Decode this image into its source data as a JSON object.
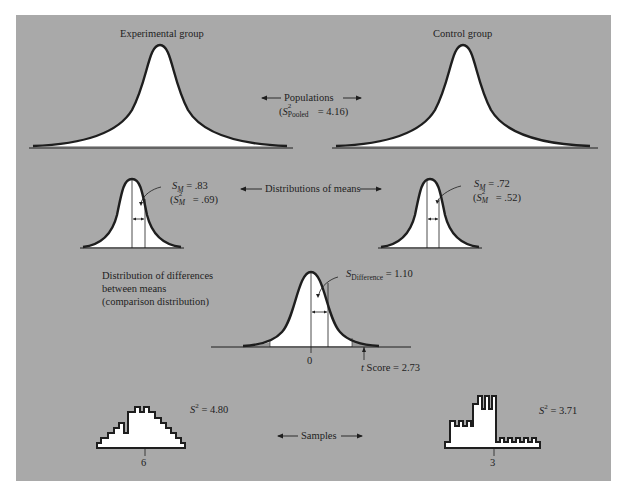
{
  "figure": {
    "background_color": "#a9a9a9",
    "curve_fill": "#ffffff",
    "stroke_color": "#1e1e1e",
    "tail_fill": "#9a9a9a"
  },
  "populations": {
    "experimental_title": "Experimental group",
    "control_title": "Control group",
    "center_label": "Populations",
    "pooled_variance": {
      "symbol": "S",
      "superscript": "2",
      "subscript": "Pooled",
      "value_text": "= 4.16)",
      "open_paren": "("
    }
  },
  "distributions_of_means": {
    "center_label": "Distributions of means",
    "experimental": {
      "sm_symbol": "S",
      "sm_sub": "M",
      "sm_value": "= .83",
      "var_symbol": "S",
      "var_sup": "2",
      "var_sub": "M",
      "var_value": "= .69)",
      "open_paren": "("
    },
    "control": {
      "sm_symbol": "S",
      "sm_sub": "M",
      "sm_value": "= .72",
      "var_symbol": "S",
      "var_sup": "2",
      "var_sub": "M",
      "var_value": "= .52)",
      "open_paren": "("
    }
  },
  "comparison_distribution": {
    "title_lines": [
      "Distribution of differences",
      "between means",
      "(comparison distribution)"
    ],
    "sd_symbol": "S",
    "sd_sub": "Difference",
    "sd_value": "= 1.10",
    "zero_tick": "0",
    "t_label_italic": "t",
    "t_label_rest": " Score = 2.73"
  },
  "samples": {
    "center_label": "Samples",
    "experimental": {
      "var_symbol": "S",
      "var_sup": "2",
      "var_value": "= 4.80",
      "mean_tick": "6"
    },
    "control": {
      "var_symbol": "S",
      "var_sup": "2",
      "var_value": "= 3.71",
      "mean_tick": "3"
    }
  }
}
